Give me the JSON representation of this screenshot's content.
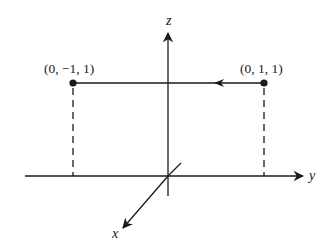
{
  "diagram": {
    "axes": {
      "x": {
        "label": "x"
      },
      "y": {
        "label": "y"
      },
      "z": {
        "label": "z"
      }
    },
    "points": [
      {
        "label": "(0, −1, 1)",
        "coords": [
          0,
          -1,
          1
        ]
      },
      {
        "label": "(0, 1, 1)",
        "coords": [
          0,
          1,
          1
        ]
      }
    ],
    "arrow": {
      "from": "(0, 1, 1)",
      "to": "(0, −1, 1)",
      "direction": "left"
    },
    "colors": {
      "stroke": "#1a1a1a",
      "background": "#ffffff"
    }
  }
}
